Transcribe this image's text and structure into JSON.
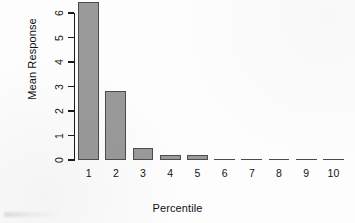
{
  "chart_data": {
    "type": "bar",
    "title": "",
    "subtitle": "",
    "xlabel": "Percentile",
    "ylabel": "Mean Response",
    "categories": [
      "1",
      "2",
      "3",
      "4",
      "5",
      "6",
      "7",
      "8",
      "9",
      "10"
    ],
    "values": [
      6.45,
      2.8,
      0.5,
      0.2,
      0.2,
      0.02,
      0.02,
      0.02,
      0.02,
      0.02
    ],
    "series": [
      {
        "name": "Mean Response",
        "values": [
          6.45,
          2.8,
          0.5,
          0.2,
          0.2,
          0.02,
          0.02,
          0.02,
          0.02,
          0.02
        ]
      }
    ],
    "ylim": [
      0,
      6.45
    ],
    "xlim": [
      0,
      10
    ],
    "y_ticks": [
      "0",
      "1",
      "2",
      "3",
      "4",
      "5",
      "6"
    ],
    "y_tick_values": [
      0,
      1,
      2,
      3,
      4,
      5,
      6
    ],
    "grid": false,
    "legend": false,
    "legend_position": "none",
    "bar_fill_color": "#9a9a9a",
    "bar_border_color": "#4c4c4c",
    "axis_color": "#1a1a1a",
    "background_color": "#fdfdfd"
  },
  "axes": {
    "y_title": "Mean Response",
    "x_title": "Percentile"
  }
}
